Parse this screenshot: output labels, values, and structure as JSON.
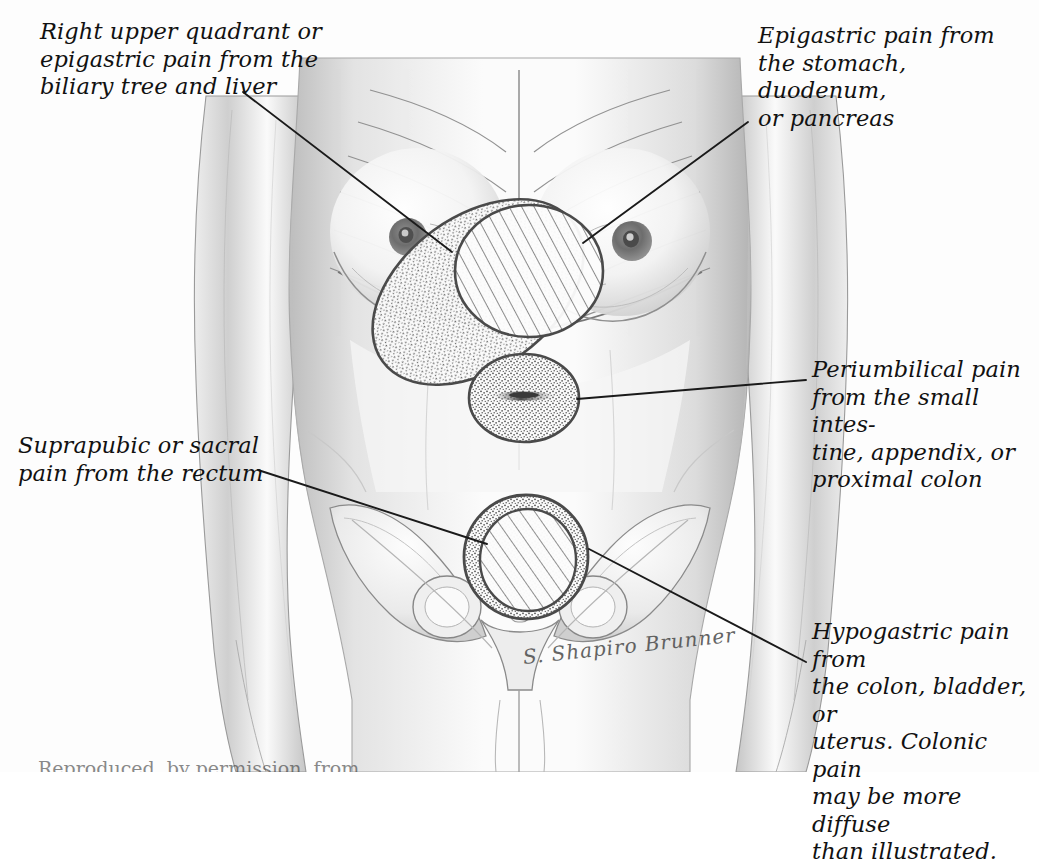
{
  "figure": {
    "background_color": "#fdfdfd",
    "ink_color": "#111111",
    "skin_shade": "#d9d9d9",
    "region_outline_color": "#4a4a4a"
  },
  "callouts": {
    "right_upper_quadrant": {
      "text": "Right upper quadrant or\nepigastric pain from the\nbiliary tree and liver",
      "position": "top-left",
      "points_to": "stippled-oval-right-upper-quadrant"
    },
    "epigastric": {
      "text": "Epigastric pain from\nthe stomach, duodenum,\nor pancreas",
      "position": "top-right",
      "points_to": "hatched-circle-epigastric"
    },
    "periumbilical": {
      "text": "Periumbilical pain\nfrom the small intes-\ntine, appendix, or\nproximal colon",
      "position": "middle-right",
      "points_to": "stippled-circle-periumbilical"
    },
    "suprapubic": {
      "text": "Suprapubic or sacral\npain from the rectum",
      "position": "middle-left",
      "points_to": "stippled-ring-suprapubic"
    },
    "hypogastric": {
      "text": "Hypogastric pain from\nthe colon, bladder, or\nuterus. Colonic pain\nmay be more diffuse\nthan illustrated.",
      "position": "bottom-right",
      "points_to": "hatched-circle-hypogastric"
    }
  },
  "signature": {
    "text": "S. Shapiro Brunner"
  },
  "bottom_caption": {
    "text": "Reproduced, by permission, from..."
  },
  "regions": [
    {
      "name": "stippled-oval-right-upper-quadrant",
      "fill": "stipple",
      "shape": "ellipse",
      "label": "Right upper quadrant / biliary tree and liver"
    },
    {
      "name": "hatched-circle-epigastric",
      "fill": "hatch",
      "shape": "ellipse",
      "label": "Epigastrium / stomach, duodenum, pancreas"
    },
    {
      "name": "stippled-circle-periumbilical",
      "fill": "stipple",
      "shape": "ellipse",
      "label": "Periumbilical / small intestine, appendix, proximal colon"
    },
    {
      "name": "stippled-ring-suprapubic",
      "fill": "stipple",
      "shape": "ring",
      "label": "Suprapubic / rectum"
    },
    {
      "name": "hatched-circle-hypogastric",
      "fill": "hatch",
      "shape": "ellipse",
      "label": "Hypogastrium / colon, bladder, uterus"
    }
  ]
}
